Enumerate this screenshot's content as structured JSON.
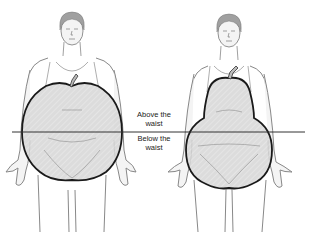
{
  "figure": {
    "figures": [
      {
        "id": "apple",
        "shape": "apple",
        "description": "Fat distributed above the waist"
      },
      {
        "id": "pear",
        "shape": "pear",
        "description": "Fat distributed below the waist"
      }
    ],
    "labels": {
      "above_line1": "Above the",
      "above_line2": "waist",
      "below_line1": "Below the",
      "below_line2": "waist"
    },
    "colors": {
      "outline": "#1a1a1a",
      "body_line": "#888888",
      "shape_fill": "#d9d9d9",
      "skin": "#f4f4f4",
      "hair": "#a0a0a0",
      "waist_line": "#333333"
    }
  }
}
